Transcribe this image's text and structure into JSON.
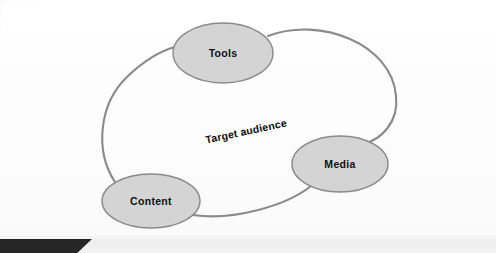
{
  "diagram": {
    "type": "cycle",
    "center_label": "Target audience",
    "center_label_rotation_deg": -12,
    "nodes": [
      {
        "id": "tools",
        "label": "Tools",
        "cx": 223,
        "cy": 53,
        "rx": 50,
        "ry": 30
      },
      {
        "id": "content",
        "label": "Content",
        "cx": 151,
        "cy": 201,
        "rx": 49,
        "ry": 27
      },
      {
        "id": "media",
        "label": "Media",
        "cx": 340,
        "cy": 164,
        "rx": 48,
        "ry": 28
      }
    ],
    "connectors": [
      {
        "id": "tools-to-media",
        "from": "tools",
        "to": "media"
      },
      {
        "id": "media-to-content",
        "from": "media",
        "to": "content"
      },
      {
        "id": "content-to-tools",
        "from": "content",
        "to": "tools"
      }
    ],
    "colors": {
      "node_fill": "#d4d4d4",
      "node_stroke": "#8a8a8a",
      "connector_stroke": "#8a8a8a",
      "label_text": "#111111",
      "background": "#fdfdfd",
      "footer_band": "#f0f0f0",
      "footer_block": "#262626"
    }
  }
}
